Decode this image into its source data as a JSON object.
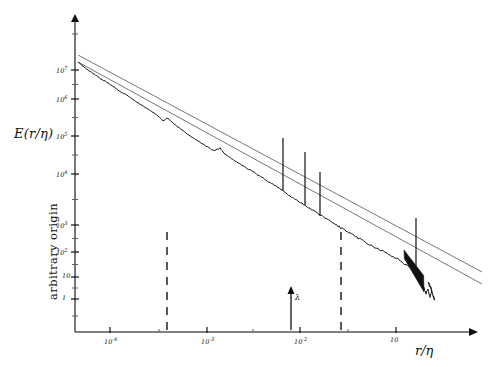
{
  "figure": {
    "background": "#ffffff",
    "ink": "#111111",
    "line_color": "#555555"
  },
  "axes": {
    "y_axis_label": "E(r/η)",
    "y_axis_sublabel": "arbitrary origin",
    "x_axis_label": "r/η",
    "x_origin_px": 75,
    "x_end_px": 478,
    "y_top_px": 14,
    "y_baseline_px": 332
  },
  "chart_data": {
    "type": "line",
    "title": "",
    "subtitle": "",
    "xlabel": "r/η",
    "ylabel": "E(r/η)",
    "ylabel_note": "arbitrary origin",
    "xscale": "log",
    "yscale": "log",
    "grid": false,
    "legend": false,
    "xlim": [
      4e-05,
      0.4
    ],
    "ylim": [
      0.3,
      40000000
    ],
    "x_ticks": [
      {
        "value": 0.0001,
        "label": "10",
        "exponent": "-4",
        "px": 110
      },
      {
        "value": 0.001,
        "label": "10",
        "exponent": "-3",
        "px": 207
      },
      {
        "value": 0.01,
        "label": "10",
        "exponent": "-2",
        "px": 300
      },
      {
        "value": 0.1,
        "label": "10",
        "exponent": "",
        "px": 396
      }
    ],
    "y_ticks": [
      {
        "value": 10000000,
        "label": "10",
        "exponent": "7",
        "px": 70
      },
      {
        "value": 1000000,
        "label": "10",
        "exponent": "6",
        "px": 99
      },
      {
        "value": 100000,
        "label": "10",
        "exponent": "5",
        "px": 136
      },
      {
        "value": 10000,
        "label": "10",
        "exponent": "4",
        "px": 174
      },
      {
        "value": 1000,
        "label": "10",
        "exponent": "3",
        "px": 225
      },
      {
        "value": 100,
        "label": "10",
        "exponent": "2",
        "px": 252
      },
      {
        "value": 10,
        "label": "10",
        "exponent": "",
        "px": 277
      },
      {
        "value": 1,
        "label": "1",
        "exponent": "",
        "px": 299
      }
    ],
    "series": [
      {
        "name": "measured spectrum",
        "kind": "noisy-line",
        "points": [
          [
            78,
            62
          ],
          [
            88,
            70
          ],
          [
            98,
            77
          ],
          [
            108,
            83
          ],
          [
            118,
            90
          ],
          [
            128,
            96
          ],
          [
            138,
            103
          ],
          [
            148,
            109
          ],
          [
            158,
            116
          ],
          [
            163,
            121
          ],
          [
            168,
            118
          ],
          [
            174,
            124
          ],
          [
            182,
            130
          ],
          [
            190,
            136
          ],
          [
            198,
            141
          ],
          [
            206,
            146
          ],
          [
            214,
            151
          ],
          [
            220,
            148
          ],
          [
            226,
            155
          ],
          [
            234,
            160
          ],
          [
            242,
            165
          ],
          [
            250,
            170
          ],
          [
            258,
            175
          ],
          [
            266,
            180
          ],
          [
            274,
            185
          ],
          [
            282,
            190
          ],
          [
            290,
            196
          ],
          [
            298,
            201
          ],
          [
            306,
            206
          ],
          [
            314,
            211
          ],
          [
            322,
            216
          ],
          [
            330,
            221
          ],
          [
            338,
            226
          ],
          [
            346,
            231
          ],
          [
            354,
            236
          ],
          [
            362,
            240
          ],
          [
            370,
            245
          ],
          [
            378,
            249
          ],
          [
            386,
            253
          ],
          [
            392,
            256
          ],
          [
            398,
            259
          ],
          [
            402,
            262
          ],
          [
            406,
            264
          ],
          [
            410,
            266
          ],
          [
            413,
            268
          ],
          [
            416,
            271
          ],
          [
            418,
            274
          ],
          [
            420,
            278
          ],
          [
            422,
            283
          ],
          [
            424,
            289
          ],
          [
            426,
            294
          ],
          [
            428,
            290
          ],
          [
            430,
            296
          ],
          [
            432,
            291
          ],
          [
            428,
            283
          ],
          [
            431,
            288
          ],
          [
            433,
            295
          ],
          [
            435,
            300
          ],
          [
            433,
            296
          ]
        ]
      },
      {
        "name": "reference line upper",
        "kind": "straight",
        "x1": 78,
        "y1": 55,
        "x2": 482,
        "y2": 272
      },
      {
        "name": "reference line lower",
        "kind": "straight",
        "x1": 78,
        "y1": 62,
        "x2": 482,
        "y2": 284
      }
    ],
    "spikes": [
      {
        "x": 283,
        "y_top": 138,
        "y_base": 191
      },
      {
        "x": 305,
        "y_top": 152,
        "y_base": 205
      },
      {
        "x": 320,
        "y_top": 172,
        "y_base": 216
      },
      {
        "x": 416,
        "y_top": 218,
        "y_base": 272
      }
    ],
    "annotations": [
      {
        "name": "dashed-marker-1",
        "type": "vertical-dashed",
        "x": 167,
        "y_top": 232,
        "y_bottom": 330
      },
      {
        "name": "dashed-marker-2",
        "type": "vertical-dashed",
        "x": 341,
        "y_top": 232,
        "y_bottom": 330
      },
      {
        "name": "lambda-arrow",
        "type": "up-arrow",
        "label": "λ",
        "x": 291,
        "y_top": 286,
        "y_bottom": 330
      }
    ]
  }
}
